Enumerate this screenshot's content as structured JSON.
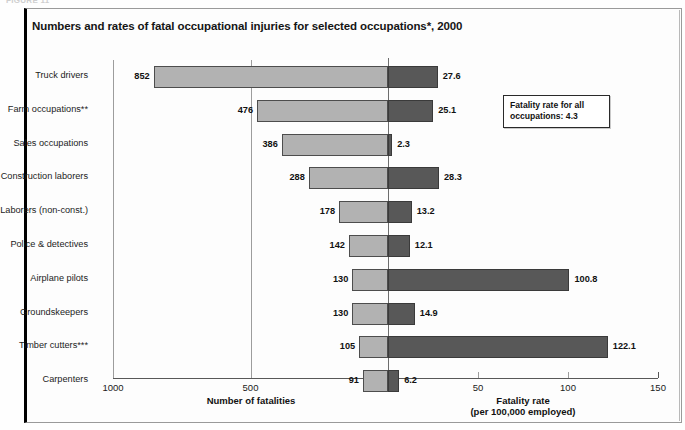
{
  "figure_caption": "FIGURE 11",
  "title": "Numbers and rates of fatal occupational injuries for selected occupations*, 2000",
  "callout": "Fatality rate for all occupations: 4.3",
  "left_axis": {
    "title": "Number of fatalities",
    "ticks": [
      "1000",
      "500",
      "0"
    ],
    "tick_values": [
      1000,
      500,
      0
    ],
    "max": 1000
  },
  "right_axis": {
    "title_line1": "Fatality rate",
    "title_line2": "(per 100,000 employed)",
    "ticks": [
      "0",
      "50",
      "100",
      "150"
    ],
    "tick_values": [
      0,
      50,
      100,
      150
    ],
    "max": 150
  },
  "colors": {
    "fatalities_bar": "#b2b2b2",
    "rate_bar": "#585858",
    "frame": "#000000",
    "gridline": "#9d9d9d"
  },
  "chart_data": {
    "type": "bar",
    "title": "Numbers and rates of fatal occupational injuries for selected occupations*, 2000",
    "orientation": "horizontal-diverging",
    "categories": [
      "Truck drivers",
      "Farm occupations**",
      "Sales occupations",
      "Construction laborers",
      "Laborers (non-const.)",
      "Police & detectives",
      "Airplane pilots",
      "Groundskeepers",
      "Timber cutters***",
      "Carpenters"
    ],
    "series": [
      {
        "name": "Number of fatalities",
        "axis": "left",
        "xlabel": "Number of fatalities",
        "xlim": [
          1000,
          0
        ],
        "values": [
          852,
          476,
          386,
          288,
          178,
          142,
          130,
          130,
          105,
          91
        ],
        "labels": [
          "852",
          "476",
          "386",
          "288",
          "178",
          "142",
          "130",
          "130",
          "105",
          "91"
        ]
      },
      {
        "name": "Fatality rate (per 100,000 employed)",
        "axis": "right",
        "xlabel": "Fatality rate (per 100,000 employed)",
        "xlim": [
          0,
          150
        ],
        "values": [
          27.6,
          25.1,
          2.3,
          28.3,
          13.2,
          12.1,
          100.8,
          14.9,
          122.1,
          6.2
        ],
        "labels": [
          "27.6",
          "25.1",
          "2.3",
          "28.3",
          "13.2",
          "12.1",
          "100.8",
          "14.9",
          "122.1",
          "6.2"
        ]
      }
    ],
    "annotations": [
      "Fatality rate for all occupations: 4.3"
    ],
    "grid": true,
    "legend": "none",
    "reference_value": 4.3
  }
}
